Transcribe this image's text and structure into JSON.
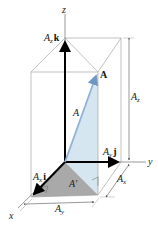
{
  "labels": {
    "z_axis": "z",
    "y_axis": "y",
    "x_axis": "x",
    "Az": "A",
    "Az_sub": "z",
    "k": "k",
    "Ay": "A",
    "Ay_sub": "y",
    "j": "j",
    "Ax": "A",
    "Ax_sub": "x",
    "i": "i",
    "vector_A": "A",
    "magnitude_A": "A",
    "A_prime": "A′",
    "dim_Az": "A",
    "dim_Az_sub": "z",
    "dim_Ax": "A",
    "dim_Ax_sub": "x",
    "dim_Ay": "A",
    "dim_Ay_sub": "y"
  },
  "colors": {
    "shade_vertical": "#d6e6f0",
    "shade_base": "#a9a9a9",
    "vector_A": "#8fb3d6",
    "axis": "#000000",
    "box": "#888888"
  }
}
